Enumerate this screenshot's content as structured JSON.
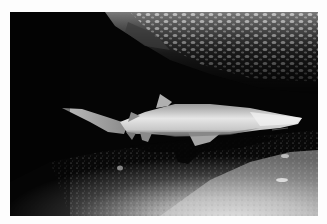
{
  "image": {
    "alt": "Grayscale underwater photograph of a sand tiger shark swimming beneath a rocky overhang above a sandy seabed",
    "subject": "sand tiger shark",
    "scene": {
      "top": "rocky reef overhang with bright speckled texture",
      "middle": "shark swimming right, lit from below/front",
      "bottom": "sandy seabed with shark's shadow, brighter toward lower right"
    },
    "colors": {
      "border": "#fdfdfd",
      "background": "#050505",
      "shark_highlight": "#e8e8e8",
      "shark_shadow": "#6a6a6a",
      "sand_bright": "#d8d8d8",
      "sand_dark": "#3a3a3a"
    }
  }
}
